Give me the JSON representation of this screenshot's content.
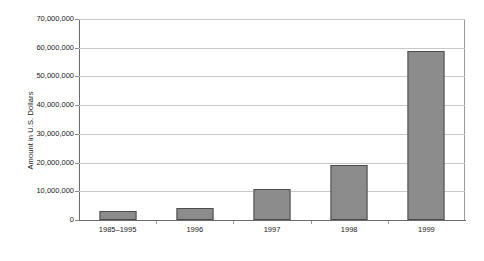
{
  "chart_data": {
    "type": "bar",
    "title": "",
    "subtitle": "",
    "xlabel": "",
    "ylabel": "Amount in U.S. Dollars",
    "categories": [
      "1985–1995",
      "1996",
      "1997",
      "1998",
      "1999"
    ],
    "values": [
      3200000,
      4300000,
      10700000,
      19000000,
      59000000
    ],
    "ylim": [
      0,
      70000000
    ],
    "ytick_values": [
      0,
      10000000,
      20000000,
      30000000,
      40000000,
      50000000,
      60000000,
      70000000
    ],
    "ytick_labels": [
      "0",
      "10,000,000",
      "20,000,000",
      "30,000,000",
      "40,000,000",
      "50,000,000",
      "60,000,000",
      "70,000,000"
    ],
    "grid": true,
    "grid_axis": "y",
    "legend": false,
    "legend_position": "none",
    "bar_color": "#8c8c8c",
    "bar_border_color": "#4d4d4d",
    "gridline_color": "#c9c9c9",
    "axis_color": "#6b6b6b",
    "background_color": "#ffffff",
    "text_color": "#1a1a1a"
  }
}
